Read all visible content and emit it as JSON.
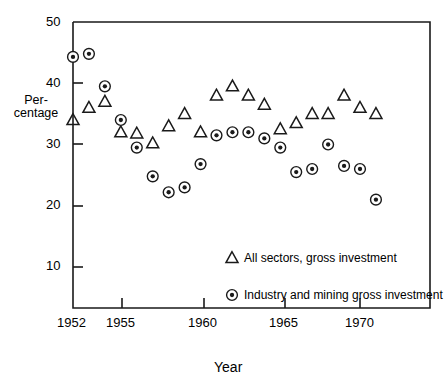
{
  "chart_data": {
    "type": "scatter",
    "title": "",
    "xlabel": "Year",
    "ylabel": "Per-\ncentage",
    "ylabel_lines": [
      "Per-",
      "centage"
    ],
    "xlim": [
      1952,
      1972
    ],
    "ylim": [
      0,
      50
    ],
    "ytick_values": [
      10,
      20,
      30,
      40,
      50
    ],
    "ytick_labels": [
      "10",
      "20",
      "30",
      "40",
      "50"
    ],
    "xtick_values": [
      1952,
      1955,
      1960,
      1965,
      1970
    ],
    "xtick_labels": [
      "1952",
      "1955",
      "1960",
      "1965",
      "1970"
    ],
    "grid": false,
    "legend_position": "lower right inside axes",
    "series": [
      {
        "name": "All sectors, gross investment",
        "marker": "triangle",
        "marker_fill": "none",
        "marker_edge_color": "#000000",
        "x": [
          1952,
          1953,
          1954,
          1955,
          1956,
          1957,
          1958,
          1959,
          1960,
          1961,
          1962,
          1963,
          1964,
          1965,
          1966,
          1967,
          1968,
          1969,
          1970,
          1971
        ],
        "values": [
          34.0,
          36.0,
          37.0,
          32.0,
          31.8,
          30.2,
          33.0,
          35.0,
          32.0,
          38.0,
          39.5,
          38.0,
          36.5,
          32.5,
          33.5,
          35.0,
          35.0,
          38.0,
          36.0,
          35.0
        ]
      },
      {
        "name": "Industry and mining gross investment",
        "marker": "circle-dot",
        "marker_fill": "#ffffff",
        "marker_edge_color": "#000000",
        "x": [
          1952,
          1953,
          1954,
          1955,
          1956,
          1957,
          1958,
          1959,
          1960,
          1961,
          1962,
          1963,
          1964,
          1965,
          1966,
          1967,
          1968,
          1969,
          1970,
          1971
        ],
        "values": [
          44.3,
          44.8,
          39.5,
          34.0,
          29.5,
          24.8,
          22.2,
          23.0,
          26.8,
          31.5,
          32.0,
          32.0,
          31.0,
          29.5,
          25.5,
          26.0,
          30.0,
          26.5,
          26.0,
          21.0
        ]
      }
    ],
    "legend_entries": [
      {
        "marker": "triangle",
        "label": "All sectors, gross investment"
      },
      {
        "marker": "circle-dot",
        "label": "Industry and mining gross investment"
      }
    ],
    "colors": {
      "axis": "#1a1a1a",
      "marker": "#1a1a1a",
      "background": "#ffffff"
    }
  }
}
